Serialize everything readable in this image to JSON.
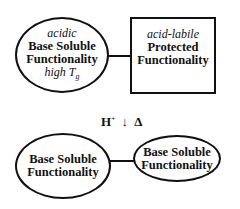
{
  "top": {
    "left_ellipse": {
      "top_label": "acidic",
      "line1": "Base Soluble",
      "line2": "Functionality",
      "bottom_label_prefix": "high T",
      "bottom_label_sub": "g"
    },
    "right_box": {
      "top_label": "acid-labile",
      "line1": "Protected",
      "line2": "Functionality"
    }
  },
  "reaction": {
    "reagent": "H",
    "reagent_sup": "+",
    "arrow": "↓",
    "heat": "Δ"
  },
  "bottom": {
    "left_ellipse": {
      "line1": "Base Soluble",
      "line2": "Functionality"
    },
    "right_ellipse": {
      "line1": "Base Soluble",
      "line2": "Functionality"
    }
  }
}
